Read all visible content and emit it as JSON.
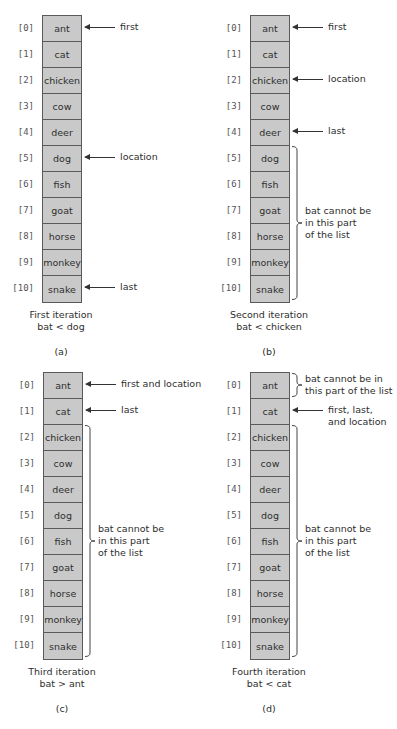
{
  "list": [
    "ant",
    "cat",
    "chicken",
    "cow",
    "deer",
    "dog",
    "fish",
    "goat",
    "horse",
    "monkey",
    "snake"
  ],
  "indices": [
    "[0]",
    "[1]",
    "[2]",
    "[3]",
    "[4]",
    "[5]",
    "[6]",
    "[7]",
    "[8]",
    "[9]",
    "[10]"
  ],
  "colors": {
    "cell_fill": "#c9c9c9",
    "cell_border": "#5a5a5a",
    "text": "#2e2e2e"
  },
  "panels": [
    {
      "id": "a",
      "caption": "First iteration\nbat < dog",
      "sublabel": "(a)",
      "pointers": [
        {
          "index": 0,
          "label": "first"
        },
        {
          "index": 5,
          "label": "location"
        },
        {
          "index": 10,
          "label": "last"
        }
      ],
      "excluded": []
    },
    {
      "id": "b",
      "caption": "Second iteration\nbat < chicken",
      "sublabel": "(b)",
      "pointers": [
        {
          "index": 0,
          "label": "first"
        },
        {
          "index": 2,
          "label": "location"
        },
        {
          "index": 4,
          "label": "last"
        }
      ],
      "excluded": [
        {
          "from": 5,
          "to": 10,
          "note": "bat cannot be\nin this part\nof the list"
        }
      ]
    },
    {
      "id": "c",
      "caption": "Third iteration\nbat > ant",
      "sublabel": "(c)",
      "pointers": [
        {
          "index": 0,
          "label": "first and location"
        },
        {
          "index": 1,
          "label": "last"
        }
      ],
      "excluded": [
        {
          "from": 2,
          "to": 10,
          "note": "bat cannot be\nin this part\nof the list"
        }
      ]
    },
    {
      "id": "d",
      "caption": "Fourth iteration\nbat < cat",
      "sublabel": "(d)",
      "pointers": [
        {
          "index": 1,
          "label": "first, last,\nand location"
        }
      ],
      "excluded": [
        {
          "from": 0,
          "to": 0,
          "note": "bat cannot be in\nthis part of the list"
        },
        {
          "from": 2,
          "to": 10,
          "note": "bat cannot be\nin this part\nof the list"
        }
      ]
    }
  ]
}
